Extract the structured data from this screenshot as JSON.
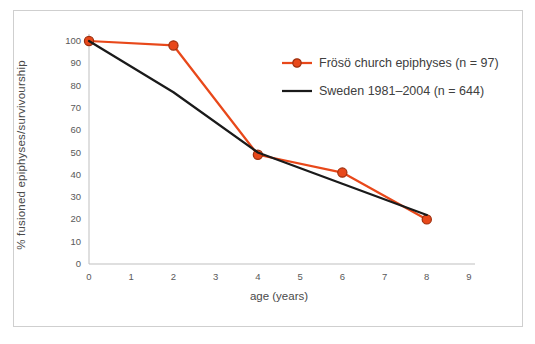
{
  "chart_data": {
    "type": "line",
    "x": [
      0,
      2,
      4,
      6,
      8
    ],
    "series": [
      {
        "name": "Frösö church epiphyses (n = 97)",
        "values": [
          100,
          98,
          49,
          41,
          20
        ],
        "color": "#e8481a",
        "marker": "circle",
        "marker_border": "#9e2f0d"
      },
      {
        "name": "Sweden 1981–2004 (n = 644)",
        "values": [
          100,
          77,
          50,
          36,
          22
        ],
        "color": "#1a1a1a",
        "marker": "none",
        "marker_border": "#1a1a1a"
      }
    ],
    "title": "",
    "xlabel": "age (years)",
    "ylabel": "% fusioned epiphyses/survivourship",
    "xlim": [
      0,
      9
    ],
    "ylim": [
      0,
      100
    ],
    "x_ticks": [
      "0",
      "1",
      "2",
      "3",
      "4",
      "5",
      "6",
      "7",
      "8",
      "9"
    ],
    "y_ticks": [
      "0",
      "10",
      "20",
      "30",
      "40",
      "50",
      "60",
      "70",
      "80",
      "90",
      "100"
    ],
    "grid": false,
    "legend_position": "inside-upper-right"
  },
  "colors": {
    "frame_border": "#cfcfcf",
    "axis_line": "#bfbfbf",
    "tick_text": "#595959",
    "axis_title_text": "#4a4a4a",
    "background": "#ffffff"
  }
}
